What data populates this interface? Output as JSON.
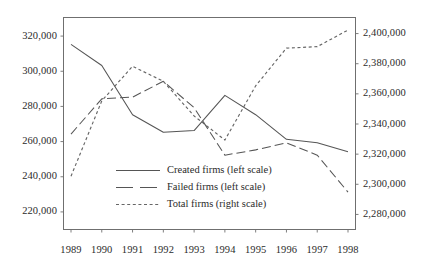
{
  "chart_data": {
    "type": "line",
    "title": "",
    "subtitle": "",
    "xlabel": "",
    "ylabel": "",
    "grid": false,
    "legend_position": "inside-lower-center",
    "x": [
      1989,
      1990,
      1991,
      1992,
      1993,
      1994,
      1995,
      1996,
      1997,
      1998
    ],
    "xtick_labels": [
      "1989",
      "1990",
      "1991",
      "1992",
      "1993",
      "1994",
      "1995",
      "1996",
      "1997",
      "1998"
    ],
    "left_axis": {
      "label": "",
      "ylim": [
        210000,
        330000
      ],
      "ticks": [
        220000,
        240000,
        260000,
        280000,
        300000,
        320000
      ],
      "tick_labels": [
        "220,000",
        "240,000",
        "260,000",
        "280,000",
        "300,000",
        "320,000"
      ]
    },
    "right_axis": {
      "label": "",
      "ylim": [
        2270000,
        2410000
      ],
      "ticks": [
        2280000,
        2300000,
        2320000,
        2340000,
        2360000,
        2380000,
        2400000
      ],
      "tick_labels": [
        "2,280,000",
        "2,300,000",
        "2,320,000",
        "2,340,000",
        "2,360,000",
        "2,380,000",
        "2,400,000"
      ]
    },
    "series": [
      {
        "name": "Created firms (left scale)",
        "axis": "left",
        "style": "solid",
        "color": "#555555",
        "values": [
          315000,
          303000,
          275000,
          265000,
          266000,
          286000,
          275000,
          261000,
          259000,
          254000
        ]
      },
      {
        "name": "Failed firms (left scale)",
        "axis": "left",
        "style": "dashed",
        "color": "#555555",
        "values": [
          264000,
          284000,
          285000,
          294000,
          279000,
          252000,
          255000,
          259000,
          252000,
          231000
        ]
      },
      {
        "name": "Total firms (right scale)",
        "axis": "right",
        "style": "dotted",
        "color": "#666666",
        "values": [
          2305000,
          2355000,
          2378000,
          2368000,
          2345000,
          2329000,
          2365000,
          2390000,
          2391000,
          2402000
        ]
      }
    ]
  },
  "legend": {
    "items": [
      {
        "label": "Created firms (left scale)",
        "style": "solid"
      },
      {
        "label": "Failed firms (left scale)",
        "style": "dashed"
      },
      {
        "label": "Total firms (right scale)",
        "style": "dotted"
      }
    ]
  },
  "colors": {
    "axis": "#555555",
    "frame": "#6b6b6b",
    "text": "#2b2b2b",
    "background": "#ffffff"
  }
}
